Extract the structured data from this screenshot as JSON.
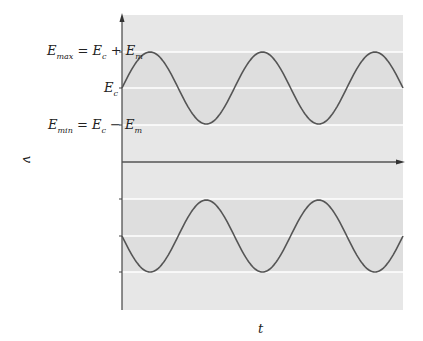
{
  "diagram": {
    "type": "amplitude-envelope",
    "y_axis_label": "v",
    "x_axis_label": "t",
    "levels": {
      "max": {
        "label_main": "E",
        "label_sub": "max",
        "rhs": "= E",
        "rhs_sub": "c",
        "rhs2": " + E",
        "rhs2_sub": "m"
      },
      "center": {
        "label_main": "E",
        "label_sub": "c"
      },
      "min": {
        "label_main": "E",
        "label_sub": "min",
        "rhs": "= E",
        "rhs_sub": "c",
        "rhs2": " − E",
        "rhs2_sub": "m"
      }
    },
    "colors": {
      "background": "#e6e6e6",
      "band": "#dcdcdc",
      "gridline": "#ffffff",
      "curve": "#555555",
      "axis": "#444444"
    },
    "upper_wave": {
      "description": "sine about Ec oscillating between Emax and Emin",
      "cycles": 2.5
    },
    "lower_wave": {
      "description": "inverted sine about zero-offset level",
      "cycles": 2.5
    }
  }
}
